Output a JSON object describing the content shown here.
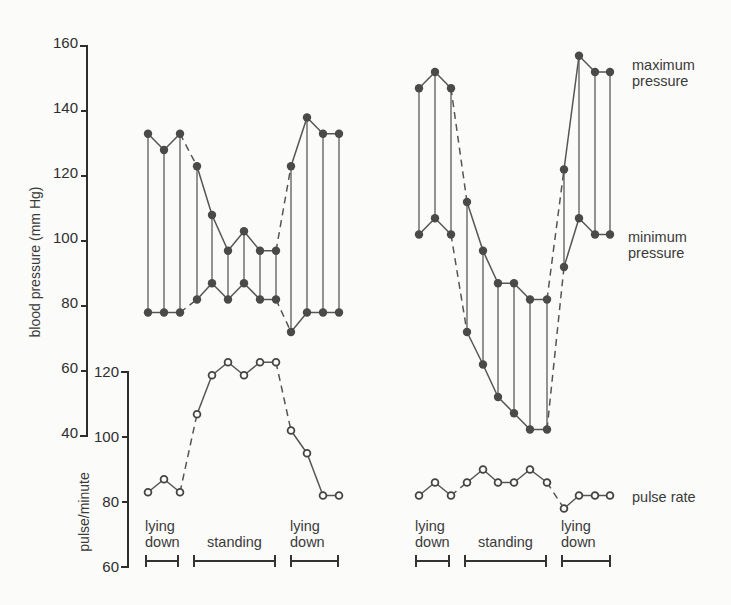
{
  "chart_data": {
    "type": "line",
    "title": "",
    "axes": {
      "blood_pressure": {
        "label": "blood pressure (mm Hg)",
        "ticks": [
          160,
          140,
          120,
          100,
          80,
          60,
          40
        ],
        "range": [
          40,
          160
        ]
      },
      "pulse": {
        "label": "pulse/minute",
        "ticks": [
          120,
          100,
          80,
          60
        ],
        "range": [
          60,
          120
        ]
      }
    },
    "legend": {
      "max": "maximum pressure",
      "min": "minimum pressure",
      "pulse": "pulse rate"
    },
    "conditions": [
      "lying down",
      "standing",
      "lying down"
    ],
    "panels": [
      {
        "name": "left",
        "x": [
          148,
          164,
          180,
          197,
          212,
          228,
          244,
          260,
          276,
          291,
          307,
          323,
          339
        ],
        "phase": [
          "lying down",
          "lying down",
          "lying down",
          "standing",
          "standing",
          "standing",
          "standing",
          "standing",
          "standing",
          "lying down",
          "lying down",
          "lying down",
          "lying down"
        ],
        "maximum_pressure": [
          133,
          128,
          133,
          123,
          108,
          97,
          103,
          97,
          97,
          123,
          138,
          133,
          133
        ],
        "minimum_pressure": [
          78,
          78,
          78,
          82,
          87,
          82,
          87,
          82,
          82,
          72,
          78,
          78,
          78
        ],
        "pulse_rate": [
          83,
          87,
          83,
          107,
          119,
          123,
          119,
          123,
          123,
          102,
          95,
          82,
          82
        ],
        "brackets": [
          [
            146,
            178
          ],
          [
            194,
            275
          ],
          [
            291,
            338
          ]
        ]
      },
      {
        "name": "right",
        "x": [
          419,
          435,
          451,
          467,
          483,
          498,
          514,
          530,
          547,
          564,
          579,
          595,
          610
        ],
        "phase": [
          "lying down",
          "lying down",
          "lying down",
          "standing",
          "standing",
          "standing",
          "standing",
          "standing",
          "standing",
          "lying down",
          "lying down",
          "lying down",
          "lying down"
        ],
        "maximum_pressure": [
          147,
          152,
          147,
          112,
          97,
          87,
          87,
          82,
          82,
          122,
          157,
          152,
          152
        ],
        "minimum_pressure": [
          102,
          107,
          102,
          72,
          62,
          52,
          47,
          42,
          42,
          92,
          107,
          102,
          102
        ],
        "pulse_rate": [
          82,
          86,
          82,
          86,
          90,
          86,
          86,
          90,
          86,
          78,
          82,
          82,
          82
        ],
        "brackets": [
          [
            416,
            449
          ],
          [
            465,
            546
          ],
          [
            562,
            610
          ]
        ]
      }
    ],
    "layout": {
      "grid": false,
      "legend_position": "right, inline labels"
    }
  }
}
